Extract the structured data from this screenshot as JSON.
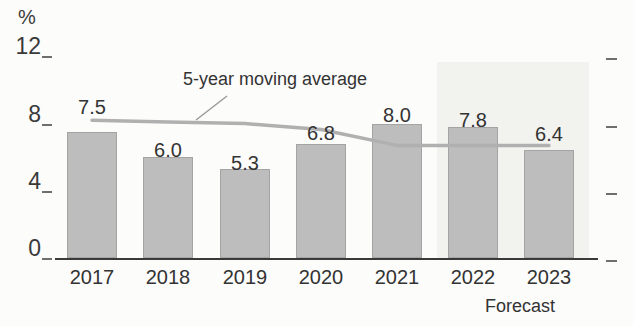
{
  "labels": {
    "unit": "%",
    "annotation": "5-year moving average",
    "forecast": "Forecast"
  },
  "chart_data": {
    "type": "bar",
    "title": "",
    "xlabel": "",
    "ylabel": "%",
    "ylim": [
      0,
      12
    ],
    "y_ticks": [
      0,
      4,
      8,
      12
    ],
    "grid": false,
    "legend_position": "inline-annotation",
    "categories": [
      "2017",
      "2018",
      "2019",
      "2020",
      "2021",
      "2022",
      "2023"
    ],
    "series": [
      {
        "name": "annual-value-bars",
        "type": "bar",
        "values": [
          7.5,
          6.0,
          5.3,
          6.8,
          8.0,
          7.8,
          6.4
        ],
        "data_labels": [
          "7.5",
          "6.0",
          "5.3",
          "6.8",
          "8.0",
          "7.8",
          "6.4"
        ]
      },
      {
        "name": "5-year moving average",
        "type": "line",
        "values": [
          8.2,
          8.1,
          8.0,
          7.65,
          6.7,
          6.7,
          6.7
        ]
      }
    ],
    "forecast_region": {
      "categories": [
        "2022",
        "2023"
      ],
      "label": "Forecast"
    }
  },
  "colors": {
    "bar_fill": "#bdbdbd",
    "bar_border": "#a4a4a4",
    "moving_average_line": "#b0b0b0",
    "leader_line": "#9b9b9b",
    "forecast_background": "#f2f2ef",
    "axis_line": "#3a3a3a",
    "text": "#333333"
  }
}
